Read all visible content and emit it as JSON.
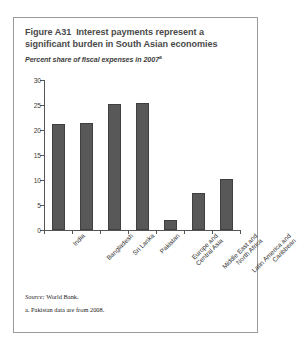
{
  "figure": {
    "number": "Figure A31",
    "title_text": "Interest payments represent a significant burden in South Asian economies",
    "subtitle_main": "Percent share of fiscal expenses in 2007",
    "subtitle_sup": "a",
    "source_label": "Source:",
    "source_value": "World Bank.",
    "footnote": "a. Pakistan data are from 2008.",
    "border_color": "#9a9a9a",
    "bar_color": "#585858",
    "title_color": "#4a4a4a"
  },
  "chart_data": {
    "type": "bar",
    "title": "Figure A31  Interest payments represent a significant burden in South Asian economies",
    "subtitle": "Percent share of fiscal expenses in 2007a",
    "xlabel": "",
    "ylabel": "",
    "ylim": [
      0,
      30
    ],
    "yticks": [
      0,
      5,
      10,
      15,
      20,
      25,
      30
    ],
    "ytick_labels": [
      "0",
      "5",
      "10",
      "15",
      "20",
      "25",
      "30"
    ],
    "grid": false,
    "legend": "none",
    "categories": [
      "India",
      "Bangladesh",
      "Sri Lanka",
      "Pakistan",
      "Europe and Central Asia",
      "Middle East and North Africa",
      "Latin America and Caribbean"
    ],
    "category_lines": [
      [
        "India"
      ],
      [
        "Bangladesh"
      ],
      [
        "Sri Lanka"
      ],
      [
        "Pakistan"
      ],
      [
        "Europe and",
        "Central Asia"
      ],
      [
        "Middle East and",
        "North Africa"
      ],
      [
        "Latin America and",
        "Caribbean"
      ]
    ],
    "values": [
      21.3,
      21.5,
      25.3,
      25.4,
      2.0,
      7.5,
      10.3
    ],
    "notes": [
      "Source: World Bank.",
      "a. Pakistan data are from 2008."
    ]
  }
}
